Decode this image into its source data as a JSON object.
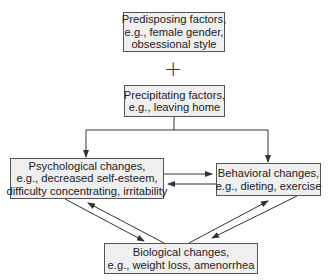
{
  "diagram": {
    "operator": "+",
    "nodes": {
      "predisposing": {
        "lines": [
          "Predisposing factors,",
          "e.g., female gender,",
          "obsessional style"
        ]
      },
      "precipitating": {
        "lines": [
          "Precipitating factors,",
          "e.g., leaving home"
        ]
      },
      "psychological": {
        "lines": [
          "Psychological changes,",
          "e.g., decreased self-esteem,",
          "difficulty concentrating, irritability"
        ]
      },
      "behavioral": {
        "lines": [
          "Behavioral changes,",
          "e.g., dieting, exercise"
        ]
      },
      "biological": {
        "lines": [
          "Biological changes,",
          "e.g., weight loss, amenorrhea"
        ]
      }
    },
    "edges": [
      {
        "from": "precipitating",
        "to": "psychological"
      },
      {
        "from": "precipitating",
        "to": "behavioral"
      },
      {
        "from": "psychological",
        "to": "behavioral"
      },
      {
        "from": "behavioral",
        "to": "psychological"
      },
      {
        "from": "psychological",
        "to": "biological"
      },
      {
        "from": "biological",
        "to": "psychological"
      },
      {
        "from": "biological",
        "to": "behavioral"
      },
      {
        "from": "behavioral",
        "to": "biological"
      }
    ],
    "colors": {
      "box_fill": "#efefef",
      "border": "#555555",
      "line": "#333333"
    }
  }
}
